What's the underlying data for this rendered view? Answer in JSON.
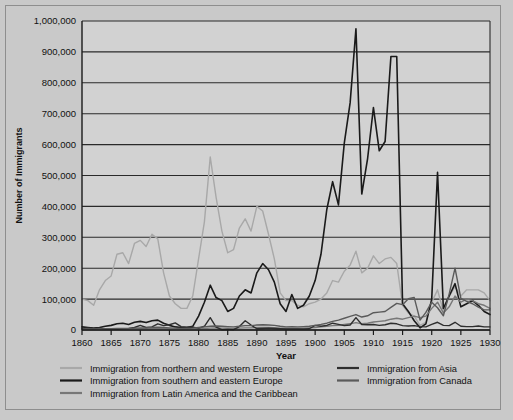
{
  "chart_data": {
    "type": "line",
    "title": "",
    "xlabel": "Year",
    "ylabel": "Number of Immigrants",
    "xlim": [
      1860,
      1930
    ],
    "ylim": [
      0,
      1000000
    ],
    "grid": "horizontal",
    "legend_position": "bottom",
    "y_ticks": [
      "0",
      "100,000",
      "200,000",
      "300,000",
      "400,000",
      "500,000",
      "600,000",
      "700,000",
      "800,000",
      "900,000",
      "1,000,000"
    ],
    "y_tick_values": [
      0,
      100000,
      200000,
      300000,
      400000,
      500000,
      600000,
      700000,
      800000,
      900000,
      1000000
    ],
    "x_ticks": [
      "1860",
      "1865",
      "1870",
      "1875",
      "1880",
      "1885",
      "1890",
      "1895",
      "1900",
      "1905",
      "1910",
      "1915",
      "1920",
      "1925",
      "1930"
    ],
    "x_tick_values": [
      1860,
      1865,
      1870,
      1875,
      1880,
      1885,
      1890,
      1895,
      1900,
      1905,
      1910,
      1915,
      1920,
      1925,
      1930
    ],
    "x": [
      1860,
      1861,
      1862,
      1863,
      1864,
      1865,
      1866,
      1867,
      1868,
      1869,
      1870,
      1871,
      1872,
      1873,
      1874,
      1875,
      1876,
      1877,
      1878,
      1879,
      1880,
      1881,
      1882,
      1883,
      1884,
      1885,
      1886,
      1887,
      1888,
      1889,
      1890,
      1891,
      1892,
      1893,
      1894,
      1895,
      1896,
      1897,
      1898,
      1899,
      1900,
      1901,
      1902,
      1903,
      1904,
      1905,
      1906,
      1907,
      1908,
      1909,
      1910,
      1911,
      1912,
      1913,
      1914,
      1915,
      1916,
      1917,
      1918,
      1919,
      1920,
      1921,
      1922,
      1923,
      1924,
      1925,
      1926,
      1927,
      1928,
      1929,
      1930
    ],
    "series": [
      {
        "name": "Immigration from northern and western Europe",
        "color": "#a8a8a8",
        "values": [
          100000,
          95000,
          80000,
          130000,
          160000,
          175000,
          245000,
          250000,
          215000,
          280000,
          290000,
          270000,
          310000,
          295000,
          185000,
          110000,
          85000,
          70000,
          70000,
          110000,
          230000,
          350000,
          560000,
          430000,
          320000,
          250000,
          260000,
          330000,
          360000,
          320000,
          400000,
          385000,
          310000,
          230000,
          120000,
          95000,
          95000,
          80000,
          75000,
          85000,
          90000,
          100000,
          120000,
          160000,
          155000,
          190000,
          210000,
          255000,
          185000,
          200000,
          240000,
          215000,
          230000,
          235000,
          215000,
          80000,
          55000,
          45000,
          15000,
          25000,
          90000,
          130000,
          60000,
          110000,
          140000,
          110000,
          130000,
          130000,
          130000,
          120000,
          95000
        ]
      },
      {
        "name": "Immigration from southern and eastern Europe",
        "color": "#1a1a1a",
        "values": [
          10000,
          8000,
          6000,
          8000,
          12000,
          15000,
          20000,
          22000,
          18000,
          25000,
          28000,
          24000,
          30000,
          32000,
          22000,
          15000,
          10000,
          8000,
          8000,
          12000,
          45000,
          90000,
          145000,
          105000,
          95000,
          60000,
          70000,
          110000,
          130000,
          120000,
          185000,
          215000,
          195000,
          155000,
          85000,
          60000,
          115000,
          70000,
          80000,
          110000,
          160000,
          245000,
          390000,
          480000,
          405000,
          605000,
          735000,
          975000,
          440000,
          555000,
          720000,
          580000,
          610000,
          885000,
          885000,
          85000,
          60000,
          30000,
          7000,
          20000,
          100000,
          510000,
          70000,
          110000,
          150000,
          75000,
          85000,
          95000,
          80000,
          60000,
          50000
        ]
      },
      {
        "name": "Immigration from Latin America and the Caribbean",
        "color": "#777777",
        "values": [
          1000,
          1000,
          1000,
          1500,
          2000,
          2500,
          3000,
          3500,
          3000,
          3500,
          4000,
          4000,
          4500,
          5000,
          4500,
          4000,
          3500,
          3000,
          3000,
          3500,
          4000,
          5000,
          6000,
          6500,
          6000,
          5500,
          5000,
          6000,
          7000,
          7000,
          8000,
          8500,
          8000,
          7500,
          6000,
          5500,
          6000,
          5500,
          6000,
          7000,
          8000,
          10000,
          12000,
          14000,
          15000,
          18000,
          20000,
          24000,
          20000,
          22000,
          26000,
          28000,
          30000,
          35000,
          38000,
          35000,
          40000,
          45000,
          40000,
          45000,
          70000,
          90000,
          55000,
          75000,
          110000,
          90000,
          100000,
          95000,
          85000,
          80000,
          70000
        ]
      },
      {
        "name": "Immigration from Asia",
        "color": "#2e2e2e",
        "values": [
          5000,
          7000,
          4000,
          7000,
          3000,
          3000,
          2500,
          4000,
          5000,
          8000,
          15000,
          8000,
          10000,
          20000,
          14000,
          17000,
          23000,
          11000,
          9000,
          9500,
          6000,
          12000,
          40000,
          9000,
          1000,
          2000,
          1000,
          11000,
          30000,
          16000,
          4000,
          5000,
          6000,
          5000,
          4000,
          3000,
          3000,
          3000,
          3000,
          4000,
          15000,
          12000,
          15000,
          22000,
          18000,
          14000,
          16000,
          40000,
          18000,
          17000,
          18000,
          15000,
          17000,
          22000,
          20000,
          14000,
          13000,
          14000,
          11000,
          10000,
          18000,
          25000,
          15000,
          14000,
          25000,
          12000,
          11000,
          11000,
          13000,
          10000,
          10000
        ]
      },
      {
        "name": "Immigration from Canada",
        "color": "#5a5a5a",
        "values": [
          3000,
          3000,
          3000,
          3500,
          4000,
          4500,
          5000,
          5000,
          5000,
          6000,
          6500,
          7000,
          8000,
          9000,
          8000,
          7000,
          6000,
          5000,
          5000,
          6000,
          8000,
          10000,
          12000,
          13000,
          12000,
          11000,
          10000,
          12000,
          14000,
          14000,
          16000,
          17000,
          16000,
          15000,
          12000,
          10000,
          11000,
          10000,
          11000,
          12000,
          15000,
          18000,
          22000,
          28000,
          32000,
          38000,
          44000,
          50000,
          42000,
          46000,
          56000,
          58000,
          60000,
          73000,
          86000,
          82000,
          101000,
          105000,
          32000,
          57000,
          90000,
          72000,
          46000,
          117000,
          200000,
          102000,
          93000,
          85000,
          74000,
          65000,
          65000
        ]
      }
    ]
  },
  "legend": {
    "col1": [
      {
        "label": "Immigration from northern and western Europe",
        "color": "#a8a8a8"
      },
      {
        "label": "Immigration from southern and eastern Europe",
        "color": "#1a1a1a"
      },
      {
        "label": "Immigration from Latin America and the Caribbean",
        "color": "#777777"
      }
    ],
    "col2": [
      {
        "label": "Immigration from Asia",
        "color": "#2e2e2e"
      },
      {
        "label": "Immigration from Canada",
        "color": "#5a5a5a"
      }
    ]
  }
}
